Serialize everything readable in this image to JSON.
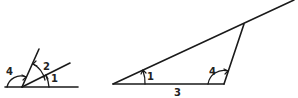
{
  "top_fragment": "",
  "figures": {
    "left": {
      "description": "Angles on a straight line with two rays from a common vertex",
      "labels": {
        "angle_left": "4",
        "angle_middle": "2",
        "angle_right": "1"
      }
    },
    "right": {
      "description": "Triangle with extended side showing angles 1, 4 and side 3",
      "labels": {
        "angle_at_left_vertex": "1",
        "angle_at_right_vertex": "4",
        "base_side": "3"
      }
    }
  },
  "colors": {
    "stroke": "#1a1a1a",
    "background": "#ffffff"
  }
}
